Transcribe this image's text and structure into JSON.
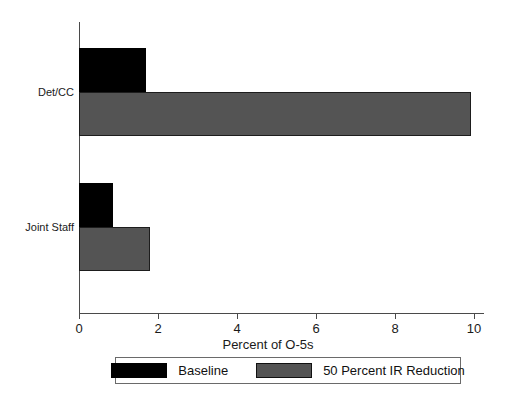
{
  "chart_data": {
    "type": "bar",
    "orientation": "horizontal",
    "title": "",
    "subtitle": "",
    "xlabel": "Percent of O-5s",
    "ylabel": "",
    "categories": [
      "Det/CC",
      "Joint Staff"
    ],
    "series": [
      {
        "name": "Baseline",
        "color": "#000000",
        "values": [
          1.75,
          0.9
        ]
      },
      {
        "name": "50 Percent IR Reduction",
        "color": "#545454",
        "values": [
          10.25,
          1.85
        ]
      }
    ],
    "xlim": [
      0,
      10.6
    ],
    "xticks": [
      0,
      2,
      4,
      6,
      8,
      10
    ],
    "xtick_labels": [
      "0",
      "2",
      "4",
      "6",
      "8",
      "10"
    ],
    "grid": false,
    "legend_position": "bottom",
    "legend_entries": [
      "Baseline",
      "50 Percent IR Reduction"
    ]
  },
  "axis": {
    "x_title": "Percent of O-5s",
    "tick_labels": [
      "0",
      "2",
      "4",
      "6",
      "8",
      "10"
    ],
    "category_labels": [
      "Det/CC",
      "Joint Staff"
    ]
  },
  "legend": {
    "items": [
      {
        "label": "Baseline",
        "color": "#000000"
      },
      {
        "label": "50 Percent IR Reduction",
        "color": "#545454"
      }
    ]
  }
}
